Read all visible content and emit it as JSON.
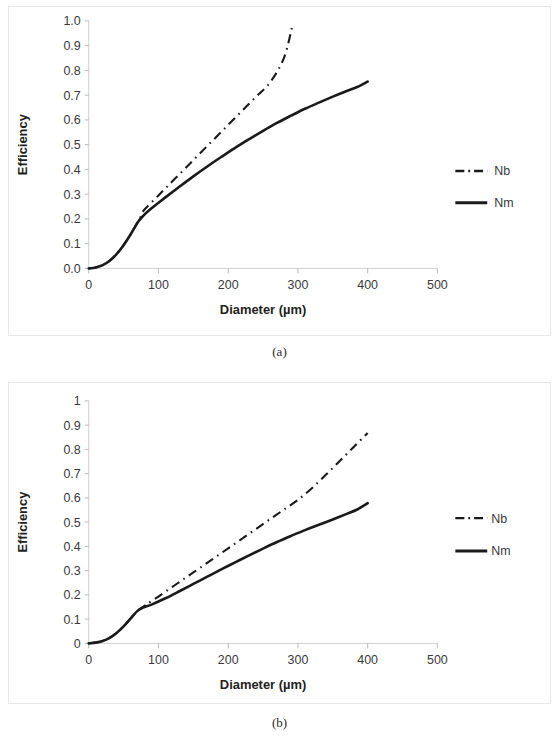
{
  "figure": {
    "captions": {
      "a": "(a)",
      "b": "(b)"
    }
  },
  "chart_data": [
    {
      "id": "a",
      "type": "line",
      "title": "",
      "xlabel": "Diameter (µm)",
      "ylabel": "Efficiency",
      "xlim": [
        0,
        500
      ],
      "ylim": [
        0,
        1.0
      ],
      "xticks": [
        0,
        100,
        200,
        300,
        400,
        500
      ],
      "xticklabels": [
        "0",
        "100",
        "200",
        "300",
        "400",
        "500"
      ],
      "yticks": [
        0.0,
        0.1,
        0.2,
        0.3,
        0.4,
        0.5,
        0.6,
        0.7,
        0.8,
        0.9,
        1.0
      ],
      "yticklabels": [
        "0.0",
        "0.1",
        "0.2",
        "0.3",
        "0.4",
        "0.5",
        "0.6",
        "0.7",
        "0.8",
        "0.9",
        "1.0"
      ],
      "grid": false,
      "legend_position": "right",
      "series": [
        {
          "name": "Nb",
          "style": "dash-dot",
          "color": "#1a1a1a",
          "x": [
            0,
            10,
            20,
            30,
            40,
            50,
            60,
            70,
            78,
            80,
            100,
            120,
            140,
            160,
            180,
            200,
            220,
            240,
            260,
            280,
            292
          ],
          "y": [
            0.0,
            0.004,
            0.013,
            0.031,
            0.058,
            0.094,
            0.137,
            0.185,
            0.228,
            0.238,
            0.295,
            0.352,
            0.409,
            0.466,
            0.523,
            0.58,
            0.637,
            0.694,
            0.751,
            0.851,
            0.98
          ]
        },
        {
          "name": "Nm",
          "style": "solid",
          "color": "#1a1a1a",
          "x": [
            0,
            10,
            20,
            30,
            40,
            50,
            60,
            70,
            78,
            90,
            110,
            130,
            150,
            170,
            190,
            210,
            230,
            250,
            270,
            290,
            310,
            330,
            350,
            370,
            385,
            400
          ],
          "y": [
            0.0,
            0.004,
            0.013,
            0.031,
            0.058,
            0.094,
            0.137,
            0.185,
            0.212,
            0.243,
            0.287,
            0.33,
            0.372,
            0.412,
            0.45,
            0.487,
            0.522,
            0.556,
            0.588,
            0.617,
            0.645,
            0.67,
            0.694,
            0.717,
            0.733,
            0.755
          ]
        }
      ]
    },
    {
      "id": "b",
      "type": "line",
      "title": "",
      "xlabel": "Diameter (µm)",
      "ylabel": "Efficiency",
      "xlim": [
        0,
        500
      ],
      "ylim": [
        0,
        1
      ],
      "xticks": [
        0,
        100,
        200,
        300,
        400,
        500
      ],
      "xticklabels": [
        "0",
        "100",
        "200",
        "300",
        "400",
        "500"
      ],
      "yticks": [
        0,
        0.1,
        0.2,
        0.3,
        0.4,
        0.5,
        0.6,
        0.7,
        0.8,
        0.9,
        1
      ],
      "yticklabels": [
        "0",
        "0.1",
        "0.2",
        "0.3",
        "0.4",
        "0.5",
        "0.6",
        "0.7",
        "0.8",
        "0.9",
        "1"
      ],
      "grid": false,
      "legend_position": "right",
      "series": [
        {
          "name": "Nb",
          "style": "dash-dot",
          "color": "#1a1a1a",
          "x": [
            0,
            10,
            20,
            30,
            40,
            50,
            60,
            70,
            80,
            85,
            100,
            120,
            140,
            160,
            180,
            200,
            220,
            240,
            260,
            280,
            300,
            320,
            340,
            360,
            380,
            400
          ],
          "y": [
            0.0,
            0.003,
            0.01,
            0.023,
            0.043,
            0.07,
            0.102,
            0.134,
            0.155,
            0.165,
            0.193,
            0.233,
            0.273,
            0.312,
            0.352,
            0.392,
            0.432,
            0.472,
            0.512,
            0.552,
            0.592,
            0.64,
            0.695,
            0.752,
            0.81,
            0.868
          ]
        },
        {
          "name": "Nm",
          "style": "solid",
          "color": "#1a1a1a",
          "x": [
            0,
            10,
            20,
            30,
            40,
            50,
            60,
            70,
            80,
            90,
            110,
            130,
            150,
            170,
            190,
            210,
            230,
            250,
            270,
            290,
            310,
            330,
            350,
            370,
            385,
            400
          ],
          "y": [
            0.0,
            0.003,
            0.01,
            0.023,
            0.043,
            0.07,
            0.102,
            0.134,
            0.15,
            0.16,
            0.186,
            0.215,
            0.245,
            0.275,
            0.305,
            0.334,
            0.363,
            0.391,
            0.418,
            0.443,
            0.467,
            0.489,
            0.511,
            0.534,
            0.552,
            0.578
          ]
        }
      ]
    }
  ]
}
